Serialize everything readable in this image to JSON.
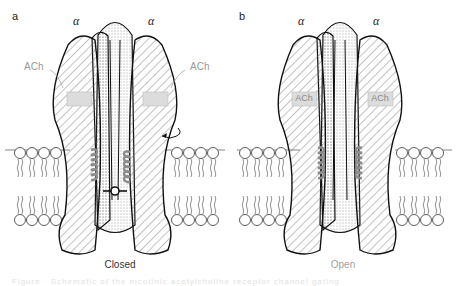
{
  "panels": [
    {
      "letter": "a",
      "subunit_left": "α",
      "subunit_right": "α",
      "ligand_left": "ACh",
      "ligand_right": "ACh",
      "ligand_bound": false,
      "state": "Closed",
      "state_color": "#333333"
    },
    {
      "letter": "b",
      "subunit_left": "α",
      "subunit_right": "α",
      "ligand_left": "ACh",
      "ligand_right": "ACh",
      "ligand_bound": true,
      "state": "Open",
      "state_color": "#a0a0a0"
    }
  ],
  "caption": "Figure  ·  Schematic of the nicotinic acetylcholine receptor channel gating",
  "colors": {
    "outline": "#111111",
    "hatch": "#555555",
    "helix": "#8c8c8c",
    "binding_site": "#dcdcdc",
    "ligand_text": "#9a9a9a"
  }
}
